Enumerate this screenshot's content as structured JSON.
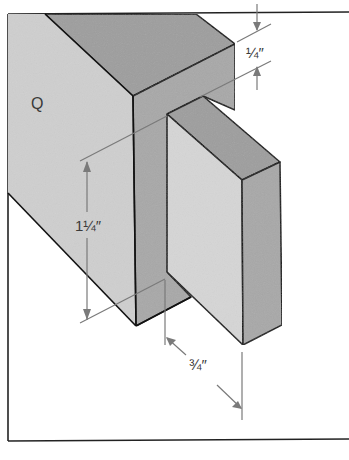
{
  "diagram": {
    "type": "isometric joinery drawing",
    "part_label": "Q",
    "dimensions": [
      {
        "id": "shoulder_top",
        "label": "1/4″",
        "display": "¼″",
        "meaning": "top shoulder width"
      },
      {
        "id": "tenon_width",
        "label": "1 1/4″",
        "display": "1¼″",
        "meaning": "tenon width (height of tenon face)"
      },
      {
        "id": "tenon_length",
        "label": "3/4″",
        "display": "¾″",
        "meaning": "tenon length (projection)"
      }
    ]
  },
  "colors": {
    "front_face": "#cfcfcf",
    "top_face": "#9e9e9e",
    "side_face": "#a8a8a8",
    "tenon_front": "#d6d6d6",
    "edge": "#111111",
    "dimension_line": "#7a7a7a",
    "frame": "#222222",
    "background": "#ffffff"
  }
}
